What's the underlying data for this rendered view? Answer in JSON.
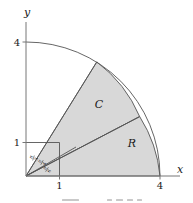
{
  "figure": {
    "type": "polar-region-diagram",
    "background_color": "#ffffff",
    "stroke_color": "#555555",
    "shade_color": "#d8d8d8",
    "axes": {
      "x_label": "x",
      "y_label": "y",
      "x_ticks": [
        "1",
        "4"
      ],
      "y_ticks": [
        "1",
        "4"
      ]
    },
    "regions": [
      {
        "label": "C",
        "description": "outer shaded sector"
      },
      {
        "label": "R",
        "description": "lower shaded sector"
      }
    ],
    "angle_labels": [
      {
        "numerator": "π",
        "denominator": "3"
      },
      {
        "numerator": "π",
        "denominator": "4"
      },
      {
        "numerator": "π",
        "denominator": "6"
      }
    ],
    "unit_square": {
      "x_side": "1",
      "y_side": "1"
    },
    "arc": {
      "radius_label": "4",
      "inner_radius_label": "1"
    }
  }
}
